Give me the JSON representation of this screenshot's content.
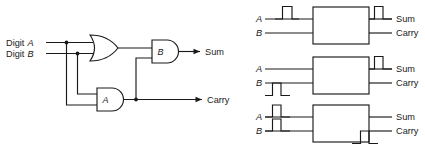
{
  "figure": {
    "ink_color": "#1a1a1a",
    "background_color": "#ffffff"
  },
  "circuit": {
    "inputs": [
      {
        "id": "digit-a",
        "label_prefix": "Digit",
        "label_var": "A",
        "full_label": "Digit A"
      },
      {
        "id": "digit-b",
        "label_prefix": "Digit",
        "label_var": "B",
        "full_label": "Digit B"
      }
    ],
    "gates": [
      {
        "id": "or-gate",
        "type": "OR",
        "label": ""
      },
      {
        "id": "and-gate-a",
        "type": "AND",
        "label": "A"
      },
      {
        "id": "and-gate-b",
        "type": "AND",
        "label": "B"
      }
    ],
    "outputs": [
      {
        "id": "sum-output",
        "label": "Sum"
      },
      {
        "id": "carry-output",
        "label": "Carry"
      }
    ],
    "junction_count": 4
  },
  "cases": [
    {
      "id": "case-1",
      "input_labels": {
        "a": "A",
        "b": "B"
      },
      "output_labels": {
        "sum": "Sum",
        "carry": "Carry"
      },
      "input_pulse": "A",
      "output_pulse": "Sum"
    },
    {
      "id": "case-2",
      "input_labels": {
        "a": "A",
        "b": "B"
      },
      "output_labels": {
        "sum": "Sum",
        "carry": "Carry"
      },
      "input_pulse": "B",
      "output_pulse": "Sum"
    },
    {
      "id": "case-3",
      "input_labels": {
        "a": "A",
        "b": "B"
      },
      "output_labels": {
        "sum": "Sum",
        "carry": "Carry"
      },
      "input_pulse": "A and B",
      "output_pulse": "Carry"
    }
  ]
}
